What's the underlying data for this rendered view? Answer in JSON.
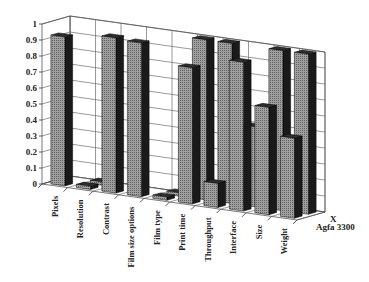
{
  "chart_data": {
    "type": "bar",
    "subtype": "3d-column",
    "title": "",
    "xlabel": "",
    "ylabel": "",
    "ylim": [
      0,
      1
    ],
    "yticks": [
      "0",
      "0.1",
      "0.2",
      "0.3",
      "0.4",
      "0.5",
      "0.6",
      "0.7",
      "0.8",
      "0.9",
      "1"
    ],
    "grid": true,
    "categories": [
      "Pixels",
      "Resolution",
      "Contrast",
      "Film size options",
      "Film type",
      "Print time",
      "Throughput",
      "Interface",
      "Size",
      "Weight"
    ],
    "series": [
      {
        "name": "Agfa 3300",
        "values": [
          0.93,
          0.02,
          0.97,
          0.96,
          0.02,
          0.85,
          0.15,
          0.93,
          0.67,
          0.5
        ]
      },
      {
        "name": "X",
        "values": [
          0,
          0.02,
          0,
          0,
          0.02,
          1.0,
          1.0,
          0.5,
          1.0,
          1.0
        ]
      }
    ],
    "legend_position": "depth-axis-right",
    "colors": {
      "front_face": "#8c8c8c",
      "side": "#1a1a1a",
      "top": "#2e2e2e",
      "grid": "#555555"
    }
  }
}
